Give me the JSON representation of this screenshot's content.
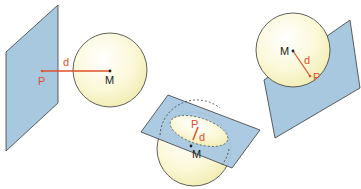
{
  "colors": {
    "plane_fill": "#a8c8e0",
    "plane_stroke": "#3a3a3a",
    "sphere_fill_center": "#ffffff",
    "sphere_fill_edge": "#f3efb8",
    "distance_color": "#e0502a",
    "point_color": "#222222"
  },
  "scenes": [
    {
      "name": "sphere-outside-plane",
      "labels": {
        "plane_point": "P",
        "distance": "d",
        "center": "M"
      }
    },
    {
      "name": "plane-intersects-sphere",
      "labels": {
        "plane_point": "P",
        "distance": "d",
        "center": "M"
      }
    },
    {
      "name": "plane-tangent-sphere",
      "labels": {
        "plane_point": "P",
        "distance": "d",
        "center": "M"
      }
    }
  ]
}
